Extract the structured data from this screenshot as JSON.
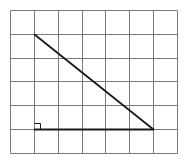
{
  "canvas": {
    "width": 188,
    "height": 159,
    "background": "#ffffff"
  },
  "grid": {
    "origin_x": 10,
    "origin_y": 10,
    "columns": 7,
    "rows": 6,
    "cell_width": 23.857,
    "cell_height": 23.833,
    "line_color": "#7a7a7a",
    "line_width": 1
  },
  "triangle": {
    "color": "#1a1a1a",
    "line_width": 1.8,
    "vertices_grid": {
      "top": [
        1,
        1
      ],
      "right_angle": [
        1,
        5
      ],
      "right": [
        6,
        5
      ]
    },
    "drawn_segments": [
      "hypotenuse",
      "base"
    ],
    "right_angle_marker": {
      "size": 6,
      "color": "#1a1a1a",
      "line_width": 1
    }
  }
}
